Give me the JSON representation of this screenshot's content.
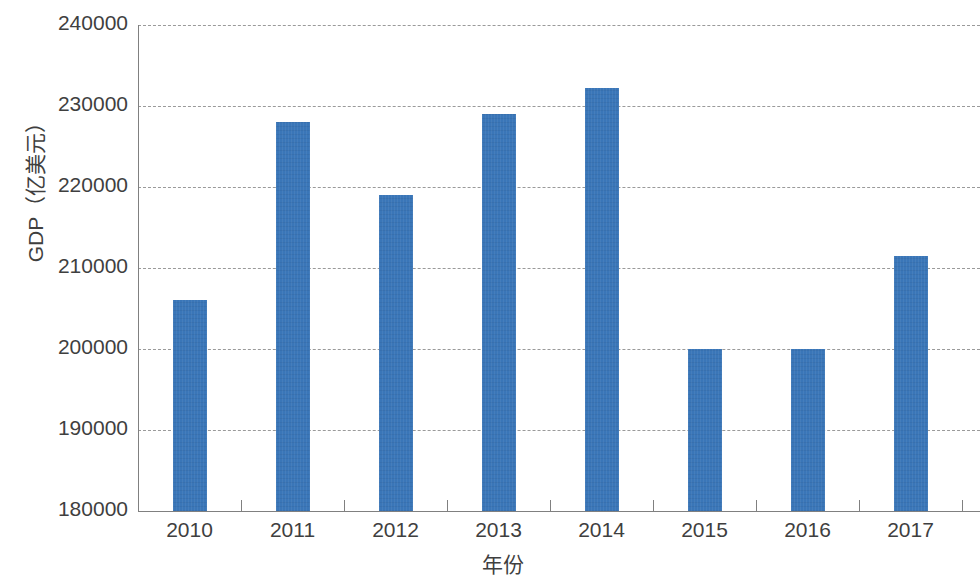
{
  "chart_data": {
    "type": "bar",
    "title": "",
    "xlabel": "年份",
    "ylabel": "GDP（亿美元）",
    "categories": [
      "2010",
      "2011",
      "2012",
      "2013",
      "2014",
      "2015",
      "2016",
      "2017"
    ],
    "values": [
      206000,
      228000,
      219000,
      229000,
      232200,
      200000,
      200000,
      211500
    ],
    "series": [
      {
        "name": "GDP",
        "values": [
          206000,
          228000,
          219000,
          229000,
          232200,
          200000,
          200000,
          211500
        ]
      }
    ],
    "ylim": [
      180000,
      240000
    ],
    "ytick_labels": [
      "240000",
      "230000",
      "220000",
      "210000",
      "200000",
      "190000",
      "180000"
    ],
    "ytick_values": [
      240000,
      230000,
      220000,
      210000,
      200000,
      190000,
      180000
    ],
    "xtick_labels": [
      "2010",
      "2011",
      "2012",
      "2013",
      "2014",
      "2015",
      "2016",
      "2017"
    ],
    "grid": true,
    "grid_style": "dashed-horizontal",
    "legend": "none",
    "bar_color": "#3a76b8",
    "axis_color": "#808080",
    "grid_color": "#9a9a9a",
    "text_color": "#3f3f3f"
  }
}
